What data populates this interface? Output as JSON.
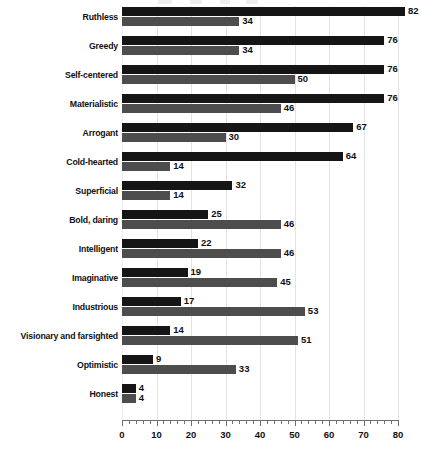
{
  "chart_data": {
    "type": "bar",
    "orientation": "horizontal",
    "title": "",
    "xlabel": "",
    "ylabel": "",
    "xlim": [
      0,
      80
    ],
    "xticks": [
      0,
      10,
      20,
      30,
      40,
      50,
      60,
      70,
      80
    ],
    "xtick_labels": [
      "0",
      "10",
      "20",
      "30",
      "40",
      "50",
      "60",
      "70",
      "80"
    ],
    "minor_tick_step": 2,
    "grid": true,
    "grid_axis": "x",
    "legend": [],
    "legend_position": "none",
    "categories": [
      "Ruthless",
      "Greedy",
      "Self-centered",
      "Materialistic",
      "Arrogant",
      "Cold-hearted",
      "Superficial",
      "Bold, daring",
      "Intelligent",
      "Imaginative",
      "Industrious",
      "Visionary and farsighted",
      "Optimistic",
      "Honest"
    ],
    "series": [
      {
        "name": "series-1",
        "color": "#151515",
        "values": [
          82,
          76,
          76,
          76,
          67,
          64,
          32,
          25,
          22,
          19,
          17,
          14,
          9,
          4
        ]
      },
      {
        "name": "series-2",
        "color": "#4d4d4d",
        "values": [
          34,
          34,
          50,
          46,
          30,
          14,
          14,
          46,
          46,
          45,
          53,
          51,
          33,
          4
        ]
      }
    ]
  },
  "colors": {
    "series_1": "#151515",
    "series_2": "#4d4d4d",
    "gridline": "#e3e3e3",
    "axis": "#6f6f6f",
    "text": "#111111",
    "background": "#ffffff"
  }
}
